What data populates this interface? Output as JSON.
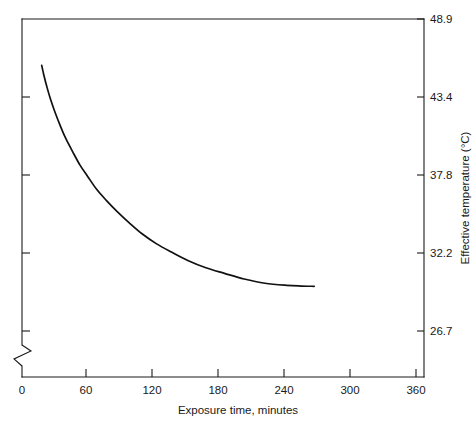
{
  "chart_data": {
    "type": "line",
    "title": "",
    "xlabel": "Exposure time, minutes",
    "ylabel": "Effective temperature (°C)",
    "xlim": [
      0,
      371
    ],
    "ylim": [
      24.0,
      48.9
    ],
    "grid": false,
    "legend": "none",
    "y_axis_break": true,
    "y_axis_break_note": "zigzag break on left axis below 26.7",
    "xticks": [
      0,
      60,
      120,
      180,
      240,
      300,
      360
    ],
    "xticklabels": [
      "0",
      "60",
      "120",
      "180",
      "240",
      "300",
      "360"
    ],
    "yticks": [
      26.7,
      32.2,
      37.8,
      43.4,
      48.9
    ],
    "yticklabels": [
      "26.7",
      "32.2",
      "37.8",
      "43.4",
      "48.9"
    ],
    "ytick_side": "right",
    "series": [
      {
        "name": "effective temperature",
        "color": "#111111",
        "x": [
          18,
          20,
          23,
          26,
          30,
          35,
          40,
          46,
          53,
          60,
          68,
          77,
          87,
          98,
          110,
          123,
          137,
          152,
          168,
          185,
          203,
          222,
          242,
          255,
          267
        ],
        "y": [
          45.6,
          44.9,
          44.0,
          43.2,
          42.3,
          41.3,
          40.4,
          39.5,
          38.5,
          37.7,
          36.8,
          36.0,
          35.2,
          34.4,
          33.6,
          32.9,
          32.3,
          31.7,
          31.2,
          30.8,
          30.4,
          30.1,
          29.95,
          29.9,
          29.88
        ]
      }
    ]
  },
  "labels": {
    "x0": "0",
    "x60": "60",
    "x120": "120",
    "x180": "180",
    "x240": "240",
    "x300": "300",
    "x360": "360",
    "y267": "26.7",
    "y322": "32.2",
    "y378": "37.8",
    "y434": "43.4",
    "y489": "48.9",
    "xtitle": "Exposure time, minutes",
    "ytitle": "Effective temperature (°C)"
  }
}
